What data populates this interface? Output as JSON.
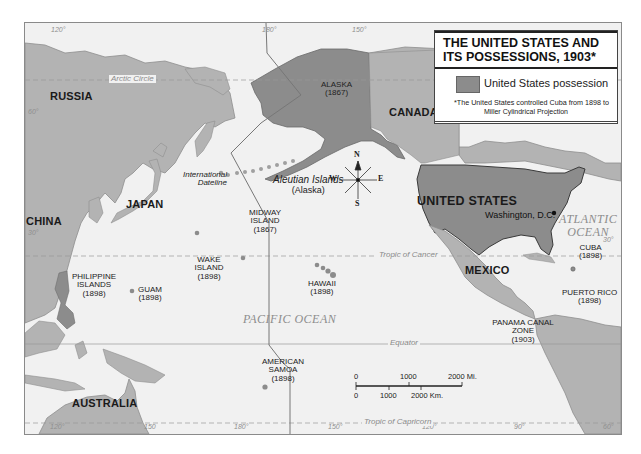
{
  "legend": {
    "title_line1": "THE UNITED STATES AND",
    "title_line2": "ITS POSSESSIONS, 1903*",
    "key_label": "United States possession",
    "swatch_color": "#8c8c8c",
    "footnote": "*The United States controlled Cuba from 1898 to 1902, when it became independent",
    "projection": "Miller Cylindrical Projection"
  },
  "countries": {
    "russia": "RUSSIA",
    "china": "CHINA",
    "japan": "JAPAN",
    "canada": "CANADA",
    "united_states": "UNITED STATES",
    "mexico": "MEXICO",
    "australia": "AUSTRALIA"
  },
  "capital": "Washington, D.C.",
  "possessions": [
    {
      "name": "ALASKA",
      "year": "(1867)"
    },
    {
      "name": "MIDWAY ISLAND",
      "year": "(1867)"
    },
    {
      "name": "WAKE ISLAND",
      "year": "(1898)"
    },
    {
      "name": "HAWAII",
      "year": "(1898)"
    },
    {
      "name": "GUAM",
      "year": "(1898)"
    },
    {
      "name": "PHILIPPINE ISLANDS",
      "year": "(1898)"
    },
    {
      "name": "AMERICAN SAMOA",
      "year": "(1898)"
    },
    {
      "name": "CUBA",
      "year": "(1898)"
    },
    {
      "name": "PUERTO RICO",
      "year": "(1898)"
    },
    {
      "name": "PANAMA CANAL ZONE",
      "year": "(1903)"
    }
  ],
  "features": {
    "aleutian": "Aleutian Islands",
    "aleutian_sub": "(Alaska)",
    "dateline": "International Dateline",
    "pacific": "PACIFIC OCEAN",
    "atlantic_1": "ATLANTIC",
    "atlantic_2": "OCEAN"
  },
  "lines": {
    "arctic": "Arctic Circle",
    "cancer": "Tropic of Cancer",
    "equator": "Equator",
    "capricorn": "Tropic of Capricorn"
  },
  "degrees": {
    "top_120": "120°",
    "top_180": "180°",
    "top_150": "150°",
    "left_60": "60°",
    "left_30": "30°",
    "right_30": "30°",
    "bot_120w": "120°",
    "bot_150e": "150",
    "bot_180": "180°",
    "bot_150": "150°",
    "bot_120": "120°",
    "bot_90": "90°",
    "bot_60": "60°"
  },
  "compass": {
    "n": "N",
    "s": "S",
    "e": "E",
    "w": "W"
  },
  "scale": {
    "mi_0": "0",
    "mi_1000": "1000",
    "mi_2000": "2000 Mi.",
    "km_0": "0",
    "km_1000": "1000",
    "km_2000": "2000 Km."
  },
  "colors": {
    "ocean": "#f1f1f1",
    "land": "#b4b4b4",
    "us_possession": "#8c8c8c"
  }
}
